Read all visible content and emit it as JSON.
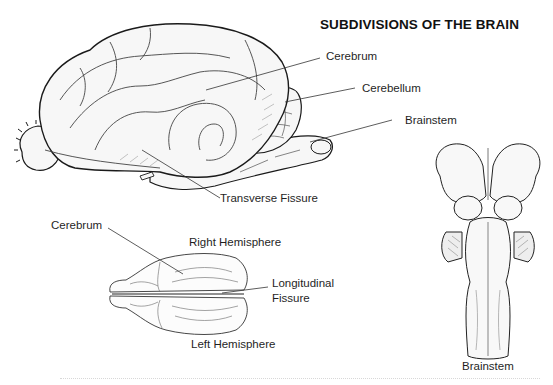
{
  "title": "SUBDIVISIONS OF THE BRAIN",
  "lateral_view": {
    "labels": {
      "cerebrum": "Cerebrum",
      "cerebellum": "Cerebellum",
      "brainstem": "Brainstem",
      "transverse_fissure": "Transverse Fissure"
    }
  },
  "dorsal_view": {
    "labels": {
      "cerebrum": "Cerebrum",
      "right_hemisphere": "Right Hemisphere",
      "longitudinal_fissure_line1": "Longitudinal",
      "longitudinal_fissure_line2": "Fissure",
      "left_hemisphere": "Left Hemisphere"
    }
  },
  "ventral_brainstem_view": {
    "caption": "Brainstem"
  },
  "colors": {
    "ink": "#1a1a1a",
    "shade": "#8a8a8a",
    "fill": "#f7f7f7",
    "background": "#ffffff"
  }
}
